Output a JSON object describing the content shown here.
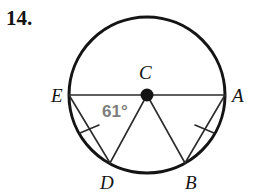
{
  "problem": {
    "number": "14."
  },
  "figure": {
    "type": "circle-geometry-diagram",
    "colors": {
      "stroke": "#141414",
      "chord_stroke": "#2b2b2b",
      "angle_text": "#7d7d7d",
      "label_text": "#141414",
      "background": "#ffffff"
    },
    "circle": {
      "center_label": "C",
      "center_x": 147,
      "center_y": 95,
      "radius": 78,
      "stroke_width": 3
    },
    "points": [
      {
        "label": "E",
        "x": 69,
        "y": 95,
        "label_x": 51,
        "label_y": 86
      },
      {
        "label": "A",
        "x": 225,
        "y": 95,
        "label_x": 232,
        "label_y": 86
      },
      {
        "label": "D",
        "x": 110,
        "y": 163,
        "label_x": 100,
        "label_y": 173
      },
      {
        "label": "B",
        "x": 185,
        "y": 163,
        "label_x": 185,
        "label_y": 173
      },
      {
        "label": "C",
        "x": 147,
        "y": 95,
        "label_x": 139,
        "label_y": 63
      }
    ],
    "segments": [
      {
        "name": "diameter-EA",
        "from": "E",
        "to": "A",
        "x1": 69,
        "y1": 95,
        "x2": 225,
        "y2": 95,
        "width": 1.6
      },
      {
        "name": "radius-CD",
        "from": "C",
        "to": "D",
        "x1": 147,
        "y1": 95,
        "x2": 110,
        "y2": 163,
        "width": 1.6
      },
      {
        "name": "radius-CB",
        "from": "C",
        "to": "B",
        "x1": 147,
        "y1": 95,
        "x2": 185,
        "y2": 163,
        "width": 1.6
      },
      {
        "name": "chord-ED",
        "from": "E",
        "to": "D",
        "x1": 69,
        "y1": 95,
        "x2": 110,
        "y2": 163,
        "width": 1.6
      },
      {
        "name": "chord-AB",
        "from": "A",
        "to": "B",
        "x1": 225,
        "y1": 95,
        "x2": 185,
        "y2": 163,
        "width": 1.6
      }
    ],
    "tick_marks": [
      {
        "name": "tick-chord-ED",
        "on_segment": "chord-ED",
        "x1": 80,
        "y1": 133,
        "x2": 99,
        "y2": 125
      },
      {
        "name": "tick-chord-AB",
        "on_segment": "chord-AB",
        "x1": 195,
        "y1": 125,
        "x2": 214,
        "y2": 133
      }
    ],
    "angle_labels": [
      {
        "name": "angle-ECD",
        "text": "61°",
        "x": 102,
        "y": 103,
        "vertex": "C",
        "rays": [
          "E",
          "D"
        ]
      }
    ]
  }
}
